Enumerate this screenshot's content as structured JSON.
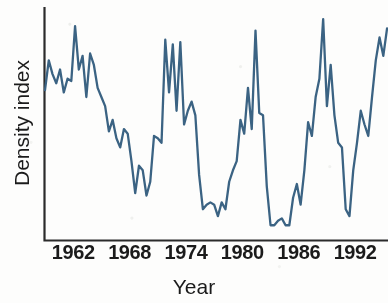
{
  "chart_data": {
    "type": "line",
    "title": "",
    "subtitle": "",
    "xlabel": "Year",
    "ylabel": "Density index",
    "xlim": [
      1959,
      1995.5
    ],
    "ylim": [
      0,
      100
    ],
    "grid": false,
    "legend": false,
    "legend_position": "none",
    "axis_style": "left-and-bottom-spines-only",
    "xticks": [
      1962,
      1968,
      1974,
      1980,
      1986,
      1992
    ],
    "xticklabels": [
      "1962",
      "1968",
      "1974",
      "1980",
      "1986",
      "1992"
    ],
    "yticks": [],
    "yticklabels": [],
    "annotations": [],
    "series": [
      {
        "name": "Density index",
        "color": "#3b6383",
        "x": [
          1959.0,
          1959.4,
          1959.8,
          1960.2,
          1960.6,
          1961.0,
          1961.4,
          1961.8,
          1962.2,
          1962.6,
          1963.0,
          1963.4,
          1963.8,
          1964.2,
          1964.6,
          1965.0,
          1965.4,
          1965.8,
          1966.2,
          1966.6,
          1967.0,
          1967.4,
          1967.8,
          1968.2,
          1968.6,
          1969.0,
          1969.4,
          1969.8,
          1970.2,
          1970.6,
          1971.0,
          1971.4,
          1971.8,
          1972.2,
          1972.6,
          1973.0,
          1973.4,
          1973.8,
          1974.2,
          1974.6,
          1975.0,
          1975.4,
          1975.8,
          1976.2,
          1976.6,
          1977.0,
          1977.4,
          1977.8,
          1978.2,
          1978.6,
          1979.0,
          1979.4,
          1979.8,
          1980.2,
          1980.6,
          1981.0,
          1981.4,
          1981.8,
          1982.2,
          1982.6,
          1983.0,
          1983.4,
          1983.8,
          1984.2,
          1984.6,
          1985.0,
          1985.4,
          1985.8,
          1986.2,
          1986.6,
          1987.0,
          1987.4,
          1987.8,
          1988.2,
          1988.6,
          1989.0,
          1989.4,
          1989.8,
          1990.2,
          1990.6,
          1991.0,
          1991.4,
          1991.8,
          1992.2,
          1992.6,
          1993.0,
          1993.4,
          1993.8,
          1994.2,
          1994.6,
          1995.0,
          1995.4
        ],
        "y": [
          65,
          78,
          72,
          68,
          74,
          64,
          70,
          69,
          93,
          74,
          80,
          62,
          81,
          76,
          66,
          62,
          58,
          47,
          52,
          44,
          40,
          48,
          46,
          34,
          20,
          32,
          30,
          19,
          25,
          45,
          44,
          42,
          87,
          64,
          85,
          56,
          86,
          50,
          56,
          60,
          54,
          28,
          13,
          15,
          16,
          15,
          10,
          16,
          13,
          25,
          30,
          34,
          52,
          46,
          66,
          48,
          91,
          55,
          54,
          23,
          6,
          6,
          8,
          9,
          6,
          6,
          18,
          24,
          15,
          30,
          51,
          45,
          62,
          70,
          96,
          58,
          76,
          54,
          42,
          40,
          13,
          10,
          30,
          42,
          56,
          50,
          45,
          62,
          78,
          88,
          80,
          92
        ]
      }
    ]
  },
  "axes": {
    "x_tick_labels": [
      "1962",
      "1968",
      "1974",
      "1980",
      "1986",
      "1992"
    ],
    "x_axis_title": "Year",
    "y_axis_title": "Density index"
  },
  "colors": {
    "line": "#3b6383",
    "axis": "#2b2b2b",
    "text": "#1b1b1b",
    "background": "#fdfdfc"
  }
}
